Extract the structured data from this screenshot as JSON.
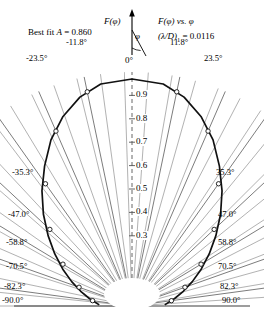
{
  "figure": {
    "best_fit_label": "Best fit",
    "best_fit_param": "A",
    "best_fit_eq": " = 0.860",
    "axis_symbol": "F(φ)",
    "title_main": "F(φ) vs. φ",
    "title_sub_pre": "(λ/D)",
    "title_sub_idx": "1",
    "title_sub_post": " = 0.0116",
    "phi_symbol": "φ",
    "zero_label": "0°",
    "axis_color": "#000000",
    "grid_color": "#5a5a5a",
    "curve_color": "#111111",
    "marker_fill": "#ffffff"
  },
  "chart_data": {
    "type": "line",
    "title": "F(φ) vs. φ",
    "xlabel": "φ",
    "ylabel": "F(φ)",
    "projection": "polar-half",
    "grid": true,
    "legend": null,
    "rlim": [
      0,
      1.0
    ],
    "r_ticks": [
      "0.9",
      "0.8",
      "0.7",
      "0.6",
      "0.5",
      "0.4",
      "0.3"
    ],
    "r_tick_values": [
      0.9,
      0.8,
      0.7,
      0.6,
      0.5,
      0.4,
      0.3
    ],
    "angle_tick_labels_left": [
      "-11.8°",
      "-23.5°",
      "-35.3°",
      "-47.0°",
      "-58.8°",
      "-70.5°",
      "-82.3°",
      "-90.0°"
    ],
    "angle_tick_labels_right": [
      "11.8°",
      "23.5°",
      "35.3°",
      "47.0°",
      "58.8°",
      "70.5°",
      "82.3°",
      "90.0°"
    ],
    "angle_tick_values": [
      -90.0,
      -82.3,
      -70.5,
      -58.8,
      -47.0,
      -35.3,
      -23.5,
      -11.8,
      0.0,
      11.8,
      23.5,
      35.3,
      47.0,
      58.8,
      70.5,
      82.3,
      90.0
    ],
    "minor_gridline_step_deg": 5.875,
    "curve": {
      "name": "Best fit A = 0.860",
      "angles_deg": [
        -88,
        -84,
        -80,
        -74,
        -68,
        -62,
        -56,
        -50,
        -44,
        -38,
        -32,
        -26,
        -20,
        -14,
        -8,
        0,
        8,
        14,
        20,
        26,
        32,
        38,
        44,
        50,
        56,
        62,
        68,
        74,
        80,
        84,
        88
      ],
      "values": [
        0.14,
        0.16,
        0.185,
        0.228,
        0.278,
        0.335,
        0.398,
        0.468,
        0.545,
        0.625,
        0.705,
        0.79,
        0.862,
        0.92,
        0.958,
        0.97,
        0.958,
        0.92,
        0.862,
        0.79,
        0.705,
        0.625,
        0.545,
        0.468,
        0.398,
        0.335,
        0.278,
        0.228,
        0.185,
        0.16,
        0.14
      ]
    },
    "points": {
      "angles_deg": [
        -82.3,
        -70.5,
        -58.8,
        -47.0,
        -35.3,
        -23.5,
        -11.8,
        11.8,
        23.5,
        35.3,
        47.0,
        58.8,
        70.5,
        82.3
      ],
      "values": [
        0.17,
        0.24,
        0.345,
        0.48,
        0.64,
        0.815,
        0.935,
        0.935,
        0.815,
        0.64,
        0.48,
        0.345,
        0.24,
        0.17
      ]
    }
  }
}
